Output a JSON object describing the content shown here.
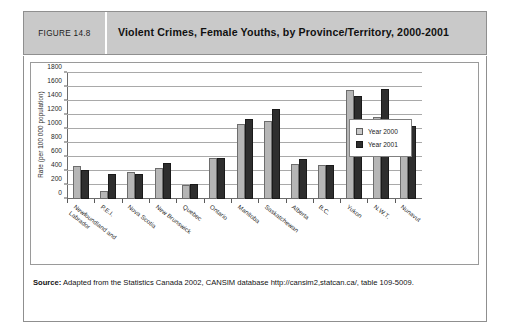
{
  "figure": {
    "tag": "FIGURE 14.8",
    "title": "Violent Crimes, Female Youths, by Province/Territory, 2000-2001",
    "source_label": "Source:",
    "source_text": " Adapted from the Statistics Canada 2002, CANSIM database http://cansim2,statcan.ca/, table 109-5009."
  },
  "colors": {
    "header_band": "#c9c9c9",
    "series_2000": "#b6b6b6",
    "series_2001": "#2e2e2e",
    "gridline": "#a9a9a9",
    "axis": "#6b6b6b",
    "frame": "#8f8f8f"
  },
  "chart_data": {
    "type": "bar",
    "title": "Violent Crimes, Female Youths, by Province/Territory, 2000-2001",
    "subtitle": "",
    "xlabel": "",
    "ylabel": "Rate (per 100 000 population)",
    "ylim": [
      0,
      1800
    ],
    "ytick_step": 200,
    "yticks": [
      0,
      200,
      400,
      600,
      800,
      1000,
      1200,
      1400,
      1600,
      1800
    ],
    "ytick_labels": [
      "0",
      "200",
      "400",
      "600",
      "800",
      "1000",
      "1200",
      "1400",
      "1600",
      "1800"
    ],
    "grid": true,
    "legend_position": "inside-right",
    "categories": [
      "Newfoundland and\nLabrador",
      "P.E.I.",
      "Nova Scotia",
      "New Brunswick",
      "Quebec",
      "Ontario",
      "Manitoba",
      "Saskatchewan",
      "Alberta",
      "B.C.",
      "Yukon",
      "N.W.T.",
      "Nunavut"
    ],
    "series": [
      {
        "name": "Year 2000",
        "color": "#b6b6b6",
        "values": [
          470,
          110,
          385,
          450,
          205,
          580,
          1070,
          1110,
          505,
          485,
          1560,
          1175,
          795
        ]
      },
      {
        "name": "Year 2001",
        "color": "#2e2e2e",
        "values": [
          420,
          360,
          360,
          510,
          210,
          590,
          1150,
          1280,
          565,
          490,
          1465,
          1565,
          1050
        ]
      }
    ]
  }
}
